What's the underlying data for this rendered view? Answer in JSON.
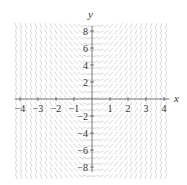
{
  "chart_data": {
    "type": "slope_field",
    "equation_hint": "dy/dx = k*x (slope depends only on x; negative for x<0, positive for x>0, steep away from y-axis)",
    "xlabel": "x",
    "ylabel": "y",
    "xlim": [
      -4,
      4
    ],
    "ylim": [
      -8,
      8
    ],
    "x_ticks": [
      -4,
      -3,
      -2,
      -1,
      1,
      2,
      3,
      4
    ],
    "y_ticks": [
      8,
      6,
      4,
      2,
      -2,
      -4,
      -6,
      -8
    ],
    "grid": false,
    "segment_color": "#cfcfcf",
    "axis_color": "#555555"
  }
}
